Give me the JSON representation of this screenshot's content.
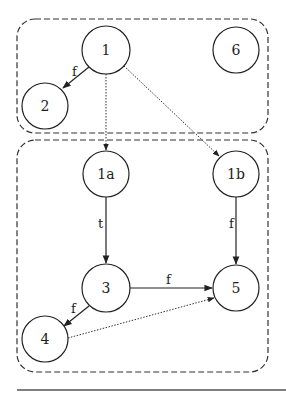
{
  "diagram": {
    "groups": [
      {
        "id": "top-group",
        "x": 17,
        "y": 19,
        "w": 251,
        "h": 114,
        "rx": 18
      },
      {
        "id": "bottom-group",
        "x": 17,
        "y": 140,
        "w": 251,
        "h": 232,
        "rx": 18
      }
    ],
    "nodes": [
      {
        "id": "1",
        "label": "1",
        "cx": 106,
        "cy": 50,
        "r": 24
      },
      {
        "id": "6",
        "label": "6",
        "cx": 236,
        "cy": 50,
        "r": 23
      },
      {
        "id": "2",
        "label": "2",
        "cx": 45,
        "cy": 106,
        "r": 23
      },
      {
        "id": "1a",
        "label": "1a",
        "cx": 106,
        "cy": 174,
        "r": 23
      },
      {
        "id": "1b",
        "label": "1b",
        "cx": 236,
        "cy": 174,
        "r": 23
      },
      {
        "id": "3",
        "label": "3",
        "cx": 106,
        "cy": 288,
        "r": 24
      },
      {
        "id": "5",
        "label": "5",
        "cx": 236,
        "cy": 288,
        "r": 23
      },
      {
        "id": "4",
        "label": "4",
        "cx": 45,
        "cy": 339,
        "r": 23
      }
    ],
    "edges": [
      {
        "from": "1",
        "to": "2",
        "label": "f",
        "style": "solid"
      },
      {
        "from": "1",
        "to": "1a",
        "label": "",
        "style": "dotted"
      },
      {
        "from": "1",
        "to": "1b",
        "label": "",
        "style": "dotted"
      },
      {
        "from": "1a",
        "to": "3",
        "label": "t",
        "style": "solid"
      },
      {
        "from": "1b",
        "to": "5",
        "label": "f",
        "style": "solid"
      },
      {
        "from": "3",
        "to": "5",
        "label": "f",
        "style": "solid"
      },
      {
        "from": "3",
        "to": "4",
        "label": "f",
        "style": "solid"
      },
      {
        "from": "4",
        "to": "5",
        "label": "",
        "style": "dotted"
      }
    ],
    "labels": {
      "n1": "1",
      "n6": "6",
      "n2": "2",
      "n1a": "1a",
      "n1b": "1b",
      "n3": "3",
      "n5": "5",
      "n4": "4",
      "e_1_2": "f",
      "e_1a_3": "t",
      "e_1b_5": "f",
      "e_3_5": "f",
      "e_3_4": "f"
    },
    "colors": {
      "stroke": "#222222",
      "background": "#ffffff",
      "rule": "#555555"
    }
  }
}
